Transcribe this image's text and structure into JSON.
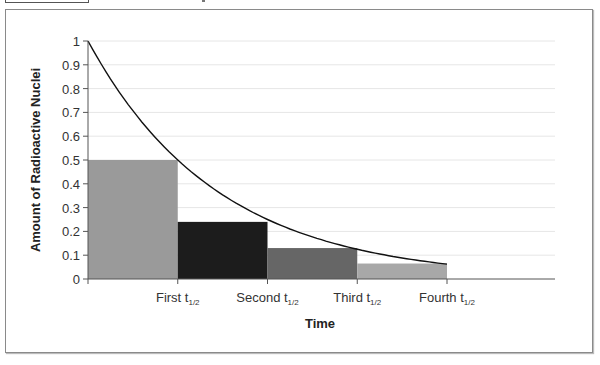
{
  "chart_data": {
    "type": "bar",
    "title": "",
    "xlabel": "Time",
    "ylabel": "Amount of Radioactive Nuclei",
    "ylim": [
      0,
      1
    ],
    "yticks": [
      "0",
      "0.1",
      "0.2",
      "0.3",
      "0.4",
      "0.5",
      "0.6",
      "0.7",
      "0.8",
      "0.9",
      "1"
    ],
    "categories": [
      "First t1/2",
      "Second t1/2",
      "Third t1/2",
      "Fourth t1/2"
    ],
    "xtick_labels": [
      {
        "main": "First t",
        "sub": "1/2"
      },
      {
        "main": "Second t",
        "sub": "1/2"
      },
      {
        "main": "Third t",
        "sub": "1/2"
      },
      {
        "main": "Fourth t",
        "sub": "1/2"
      }
    ],
    "values": [
      0.5,
      0.24,
      0.13,
      0.065
    ],
    "bar_colors": [
      "#9a9a9a",
      "#1c1c1c",
      "#666666",
      "#a8a8a8"
    ],
    "curve": {
      "type": "line",
      "description": "exponential decay",
      "x_halflives": [
        0,
        1,
        2,
        3,
        4
      ],
      "y": [
        1,
        0.5,
        0.25,
        0.125,
        0.0625
      ],
      "color": "#111111"
    },
    "grid": true,
    "legend": null
  }
}
